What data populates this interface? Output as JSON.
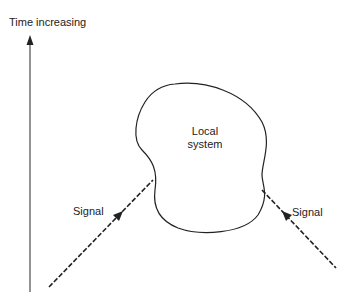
{
  "diagram": {
    "axis_label": "Time increasing",
    "system_label_line1": "Local",
    "system_label_line2": "system",
    "signal_left_label": "Signal",
    "signal_right_label": "Signal"
  },
  "colors": {
    "line": "#222222",
    "axis": "#555555",
    "background": "#ffffff"
  }
}
